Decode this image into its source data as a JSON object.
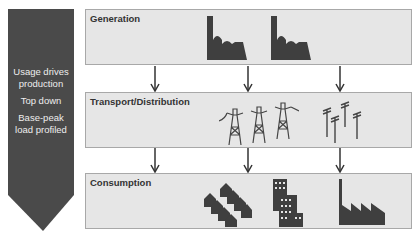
{
  "chevron": {
    "lines": [
      "Usage drives production",
      "Top down",
      "Base-peak load profiled"
    ],
    "color": "#4a4a4a"
  },
  "layers": [
    {
      "title": "Generation",
      "icons": [
        "power-plant-icon",
        "power-plant-icon"
      ]
    },
    {
      "title": "Transport/Distribution",
      "icons": [
        "transmission-tower-icon",
        "transmission-tower-icon",
        "transmission-tower-icon",
        "utility-pole-icon",
        "utility-pole-icon",
        "utility-pole-icon",
        "utility-pole-icon"
      ]
    },
    {
      "title": "Consumption",
      "icons": [
        "houses-icon",
        "office-buildings-icon",
        "factory-icon"
      ]
    }
  ],
  "colors": {
    "box_bg": "#e6e6e6",
    "box_border": "#a8a8a8",
    "icon": "#3f3f3f"
  }
}
